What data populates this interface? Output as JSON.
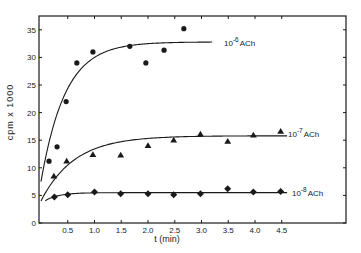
{
  "chart_data": {
    "type": "scatter",
    "title": "",
    "xlabel": "t (min)",
    "ylabel": "cpm x 1000",
    "xlim": [
      0,
      5.0
    ],
    "ylim": [
      0,
      37
    ],
    "grid": false,
    "legend_position": "inline-right",
    "x_ticks": [
      0.5,
      1.0,
      1.5,
      2.0,
      2.5,
      3.0,
      3.5,
      4.0,
      4.5
    ],
    "x_tick_labels": [
      "0.5",
      "1.0",
      "1.5",
      "2.0",
      "2.5",
      "3.0",
      "3.5",
      "4.0",
      "4.5"
    ],
    "y_ticks": [
      0,
      5,
      10,
      15,
      20,
      25,
      30,
      35
    ],
    "y_tick_labels": [
      "0",
      "5",
      "10",
      "15",
      "20",
      "25",
      "30",
      "35"
    ],
    "series": [
      {
        "name": "10^-6 ACh",
        "label_base": "10",
        "label_exp": "-6",
        "label_suffix": "ACh",
        "marker": "circle",
        "x": [
          0.15,
          0.3,
          0.47,
          0.67,
          0.97,
          1.66,
          1.96,
          2.3,
          2.67
        ],
        "y": [
          11.2,
          13.8,
          22.0,
          29.0,
          31.0,
          32.0,
          29.0,
          31.3,
          35.2
        ],
        "fit": {
          "y0": 7.5,
          "ymax": 32.8,
          "k": 2.2,
          "x_end": 3.2
        }
      },
      {
        "name": "10^-7 ACh",
        "label_base": "10",
        "label_exp": "-7",
        "label_suffix": "ACh",
        "marker": "triangle",
        "x": [
          0.24,
          0.48,
          0.97,
          1.49,
          2.0,
          2.48,
          2.98,
          3.49,
          3.97,
          4.48
        ],
        "y": [
          8.5,
          11.2,
          12.4,
          12.3,
          14.0,
          15.0,
          16.1,
          14.8,
          15.9,
          16.6
        ],
        "fit": {
          "y0": 4.0,
          "ymax": 15.8,
          "k": 1.6,
          "x_end": 4.6
        }
      },
      {
        "name": "10^-8 ACh",
        "label_base": "10",
        "label_exp": "-8",
        "label_suffix": "ACh",
        "marker": "diamond",
        "x": [
          0.25,
          0.5,
          1.0,
          1.49,
          2.0,
          2.48,
          2.98,
          3.49,
          3.97,
          4.48
        ],
        "y": [
          4.7,
          5.1,
          5.6,
          5.3,
          5.3,
          5.1,
          5.3,
          6.2,
          5.6,
          5.7
        ],
        "fit": {
          "y0": 3.5,
          "ymax": 5.5,
          "k": 4.0,
          "x_end": 4.6,
          "x_start": 0.08
        }
      }
    ]
  }
}
